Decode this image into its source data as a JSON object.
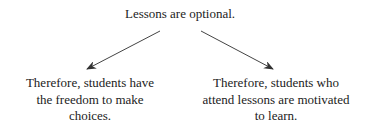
{
  "diagram": {
    "premise": "Lessons are optional.",
    "conclusions": [
      {
        "lines": [
          "Therefore, students have",
          "the freedom to make",
          "choices."
        ]
      },
      {
        "lines": [
          "Therefore, students who",
          "attend lessons are motivated",
          "to learn."
        ]
      }
    ],
    "arrows": [
      {
        "from": "premise",
        "to": "conclusion-left"
      },
      {
        "from": "premise",
        "to": "conclusion-right"
      }
    ],
    "colors": {
      "text": "#222222",
      "arrow": "#333333",
      "background": "#ffffff"
    }
  }
}
